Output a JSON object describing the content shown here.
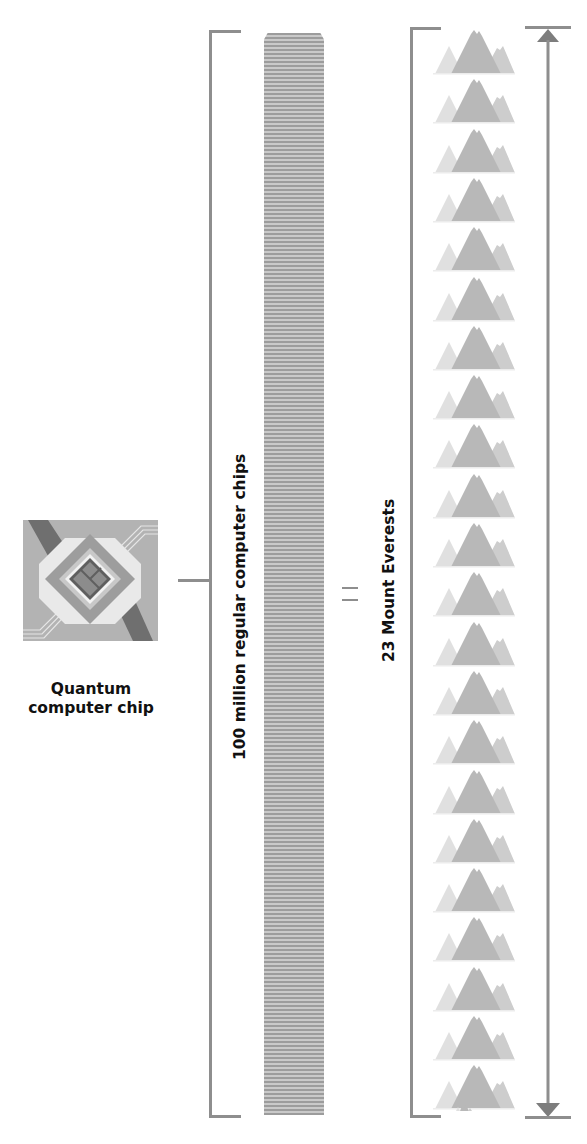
{
  "quantum_chip": {
    "label_line1": "Quantum",
    "label_line2": "computer chip",
    "icon": "quantum-chip-icon"
  },
  "regular_chips": {
    "label": "100 million regular computer chips",
    "icon": "chip-stack-icon"
  },
  "comparison": {
    "symbol": "="
  },
  "everests": {
    "label": "23 Mount Everests",
    "count": 23,
    "icon": "mountain-icon"
  },
  "height_arrow": {
    "icon": "double-headed-arrow-icon"
  },
  "colors": {
    "bracket": "#8e8e8e",
    "stack_dark": "#9c9c9c",
    "stack_light": "#c9c9c9",
    "mountain_main": "#b8b8b8",
    "mountain_side": "#cdcdcd",
    "mountain_small": "#e0e0e0",
    "text": "#111111"
  }
}
